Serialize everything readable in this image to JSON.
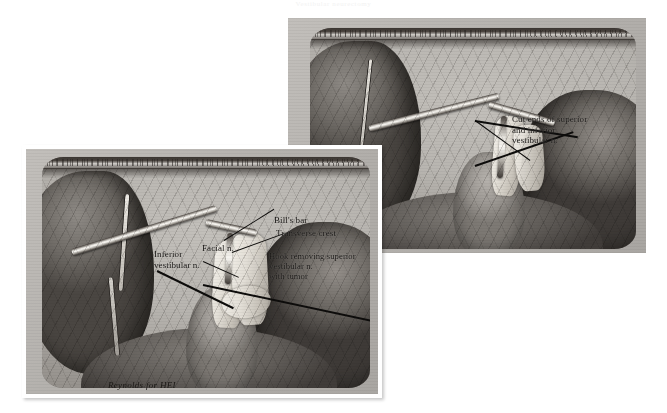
{
  "figure": {
    "top_caption": "Vestibular neurectomy",
    "signature": "Reynolds for HEI",
    "background_color": "#ffffff",
    "panel_field_color": "#b0aeab",
    "ink_color": "#141210"
  },
  "panels": [
    {
      "id": "panel-b",
      "position": "upper-right",
      "description": "Operative view after vestibular nerve section showing the cut nerve ends",
      "labels": [
        {
          "name": "cut-ends-label",
          "text": "Cut ends of superior\nand inferior\nvestibular n."
        }
      ]
    },
    {
      "id": "panel-a",
      "position": "lower-left",
      "description": "Operative view of the internal auditory canal with a hook removing the superior vestibular nerve and tumor",
      "labels": [
        {
          "name": "bills-bar-label",
          "text": "Bill's bar"
        },
        {
          "name": "transverse-crest-label",
          "text": "Transverse crest"
        },
        {
          "name": "facial-nerve-label",
          "text": "Facial n."
        },
        {
          "name": "inferior-vestibular-label",
          "text": "Inferior\nvestibular n."
        },
        {
          "name": "hook-label",
          "text": "Hook removing superior\n    vestibular n.\nwith tumor"
        }
      ]
    }
  ]
}
